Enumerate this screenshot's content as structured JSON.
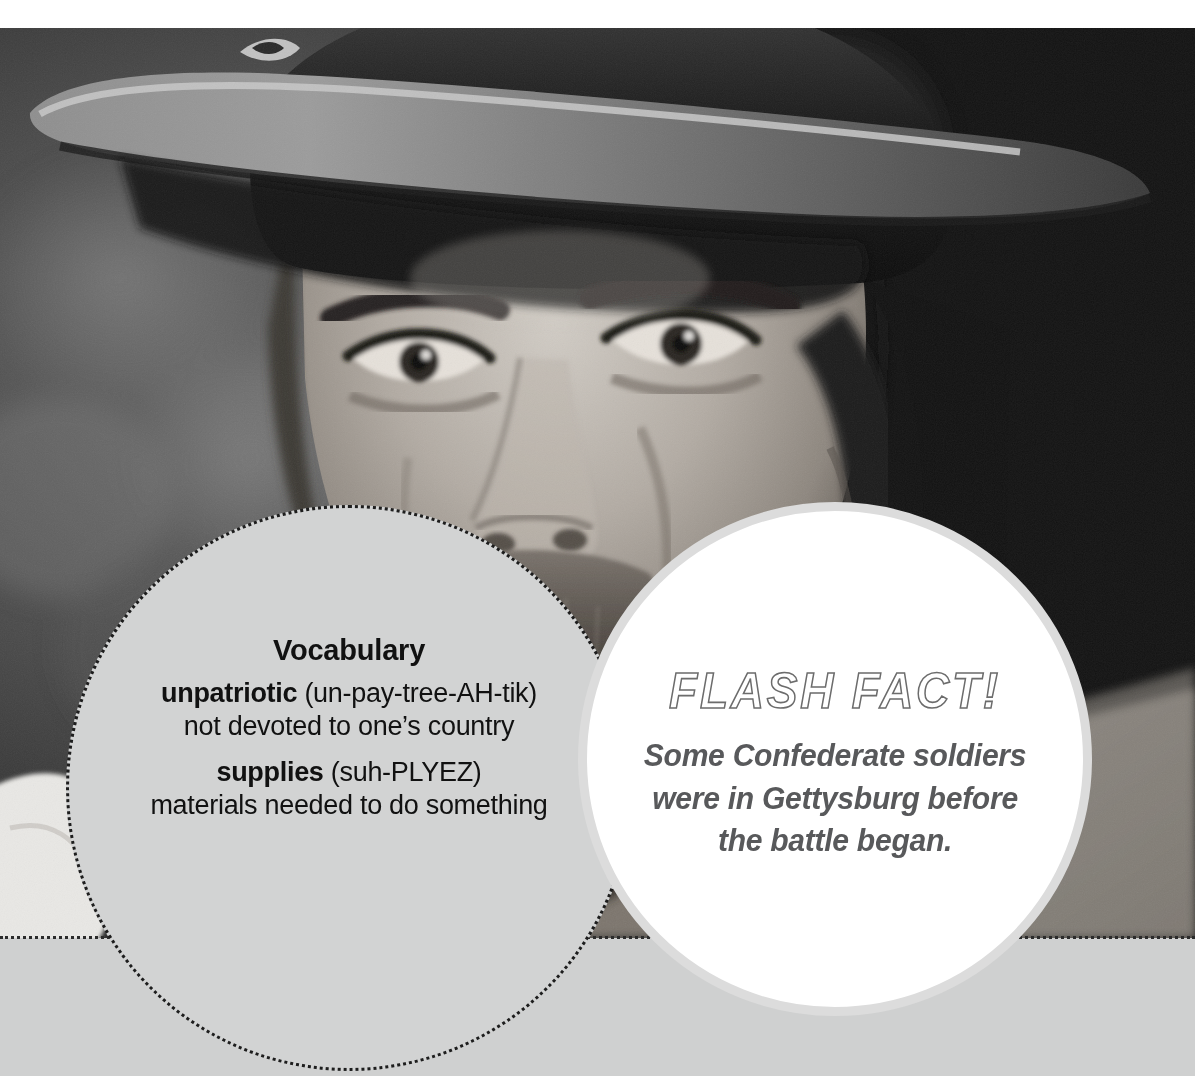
{
  "page": {
    "width": 1195,
    "height": 1076,
    "background_color": "#ffffff",
    "bottom_band_color": "#cfd0d0"
  },
  "photo": {
    "alt_description": "Black-and-white close-up portrait of a bearded Civil War reenactor wearing a slouch hat",
    "treatment": "grayscale",
    "subject": "Confederate soldier reenactor"
  },
  "vocabulary": {
    "title": "Vocabulary",
    "background_color": "#d2d3d3",
    "border_style": "dotted",
    "border_color": "#1d1d1d",
    "entries": [
      {
        "term": "unpatriotic",
        "pronunciation": "(un-pay-tree-AH-tik)",
        "definition": "not devoted to one’s country"
      },
      {
        "term": "supplies",
        "pronunciation": "(suh-PLYEZ)",
        "definition": "materials needed to do something"
      }
    ]
  },
  "flash_fact": {
    "heading": "FLASH FACT!",
    "body_lines": [
      "Some Confederate soldiers",
      "were in Gettysburg before",
      "the battle began."
    ],
    "background_color": "#ffffff",
    "ring_color": "#dcdcdc",
    "text_color": "#58595b"
  }
}
